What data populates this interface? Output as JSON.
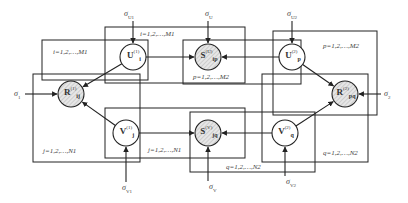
{
  "diagram": {
    "type": "probabilistic-graphical-model",
    "colors": {
      "line": "#222222",
      "hatch_fill": "#e6e6e6",
      "hatch_line": "#b5b5b5",
      "text": "#444444"
    },
    "nodes": [
      {
        "id": "U1",
        "base": "U",
        "sub": "i",
        "sup": "(1)",
        "observed": false,
        "cx": 133,
        "cy": 57
      },
      {
        "id": "SU",
        "base": "S",
        "sub": "ip",
        "sup": "(U)",
        "observed": true,
        "cx": 208,
        "cy": 57
      },
      {
        "id": "U2",
        "base": "U",
        "sub": "p",
        "sup": "(2)",
        "observed": false,
        "cx": 292,
        "cy": 57
      },
      {
        "id": "R1",
        "base": "R",
        "sub": "ij",
        "sup": "(1)",
        "observed": true,
        "cx": 71,
        "cy": 94
      },
      {
        "id": "R2",
        "base": "R",
        "sub": "pq",
        "sup": "(2)",
        "observed": true,
        "cx": 345,
        "cy": 94
      },
      {
        "id": "V1",
        "base": "V",
        "sub": "j",
        "sup": "(1)",
        "observed": false,
        "cx": 126,
        "cy": 133
      },
      {
        "id": "SV",
        "base": "S",
        "sub": "jq",
        "sup": "(V)",
        "observed": true,
        "cx": 208,
        "cy": 133
      },
      {
        "id": "V2",
        "base": "V",
        "sub": "q",
        "sup": "(2)",
        "observed": false,
        "cx": 285,
        "cy": 133
      }
    ],
    "hyperparameters": [
      {
        "id": "sigma_U1",
        "symbol": "σ",
        "sub": "U1",
        "x": 124,
        "y": 10
      },
      {
        "id": "sigma_U",
        "symbol": "σ",
        "sub": "U",
        "x": 205,
        "y": 10
      },
      {
        "id": "sigma_U2",
        "symbol": "σ",
        "sub": "U2",
        "x": 287,
        "y": 10
      },
      {
        "id": "sigma_1",
        "symbol": "σ",
        "sub": "1",
        "x": 14,
        "y": 90
      },
      {
        "id": "sigma_2",
        "symbol": "σ",
        "sub": "2",
        "x": 384,
        "y": 90
      },
      {
        "id": "sigma_V1",
        "symbol": "σ",
        "sub": "V1",
        "x": 122,
        "y": 184
      },
      {
        "id": "sigma_V",
        "symbol": "σ",
        "sub": "V",
        "x": 209,
        "y": 183
      },
      {
        "id": "sigma_V2",
        "symbol": "σ",
        "sub": "V2",
        "x": 286,
        "y": 178
      }
    ],
    "plates": [
      {
        "id": "plate-i-left",
        "label": "i=1,2,…,M1",
        "x": 42,
        "y": 40,
        "w": 106,
        "h": 40,
        "lx": 53,
        "ly": 49
      },
      {
        "id": "plate-i-top",
        "label": "i=1,2,…,M1",
        "x": 105,
        "y": 27,
        "w": 140,
        "h": 56,
        "lx": 140,
        "ly": 31
      },
      {
        "id": "plate-p-mid",
        "label": "p=1,2,…,M2",
        "x": 183,
        "y": 40,
        "w": 118,
        "h": 44,
        "lx": 193,
        "ly": 74
      },
      {
        "id": "plate-p-right",
        "label": "p=1,2,…,M2",
        "x": 273,
        "y": 31,
        "w": 104,
        "h": 84,
        "lx": 323,
        "ly": 43
      },
      {
        "id": "plate-j-left",
        "label": "j=1,2,…,N1",
        "x": 33,
        "y": 74,
        "w": 107,
        "h": 88,
        "lx": 43,
        "ly": 148
      },
      {
        "id": "plate-j-bottom",
        "label": "j=1,2,…,N1",
        "x": 105,
        "y": 108,
        "w": 140,
        "h": 50,
        "lx": 148,
        "ly": 147
      },
      {
        "id": "plate-q-mid",
        "label": "q=1,2,…,N2",
        "x": 190,
        "y": 112,
        "w": 125,
        "h": 60,
        "lx": 226,
        "ly": 164
      },
      {
        "id": "plate-q-right",
        "label": "q=1,2,…,N2",
        "x": 262,
        "y": 74,
        "w": 106,
        "h": 88,
        "lx": 323,
        "ly": 150
      }
    ],
    "edges": [
      {
        "from": "sigma_U1",
        "to": "U1"
      },
      {
        "from": "sigma_U",
        "to": "SU"
      },
      {
        "from": "sigma_U2",
        "to": "U2"
      },
      {
        "from": "sigma_1",
        "to": "R1"
      },
      {
        "from": "sigma_2",
        "to": "R2"
      },
      {
        "from": "sigma_V1",
        "to": "V1"
      },
      {
        "from": "sigma_V",
        "to": "SV"
      },
      {
        "from": "sigma_V2",
        "to": "V2"
      },
      {
        "from": "U1",
        "to": "R1"
      },
      {
        "from": "V1",
        "to": "R1"
      },
      {
        "from": "U1",
        "to": "SU"
      },
      {
        "from": "U2",
        "to": "SU"
      },
      {
        "from": "V1",
        "to": "SV"
      },
      {
        "from": "V2",
        "to": "SV"
      },
      {
        "from": "U2",
        "to": "R2"
      },
      {
        "from": "V2",
        "to": "R2"
      }
    ]
  }
}
